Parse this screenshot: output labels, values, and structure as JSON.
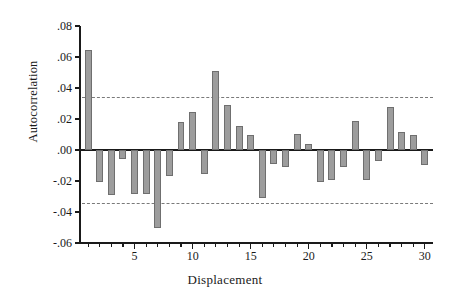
{
  "chart_data": {
    "type": "bar",
    "title": "",
    "subtitle": "",
    "xlabel": "Displacement",
    "ylabel": "Autocorrelation",
    "grid": false,
    "legend": null,
    "xlim": [
      0.3,
      30.7
    ],
    "ylim": [
      -0.06,
      0.08
    ],
    "ytick_labels": [
      ".08",
      ".06",
      ".04",
      ".02",
      ".00",
      "-.02",
      "-.04",
      "-.06"
    ],
    "ytick_values": [
      0.08,
      0.06,
      0.04,
      0.02,
      0.0,
      -0.02,
      -0.04,
      -0.06
    ],
    "xtick_labels": [
      "5",
      "10",
      "15",
      "20",
      "25",
      "30"
    ],
    "xtick_values": [
      5,
      10,
      15,
      20,
      25,
      30
    ],
    "minor_xticks": [
      1,
      2,
      3,
      4,
      5,
      6,
      7,
      8,
      9,
      10,
      11,
      12,
      13,
      14,
      15,
      16,
      17,
      18,
      19,
      20,
      21,
      22,
      23,
      24,
      25,
      26,
      27,
      28,
      29,
      30
    ],
    "annotations": [
      {
        "name": "upper-confidence-limit",
        "value": 0.034,
        "style": "dashed"
      },
      {
        "name": "lower-confidence-limit",
        "value": -0.034,
        "style": "dashed"
      }
    ],
    "categories": [
      1,
      2,
      3,
      4,
      5,
      6,
      7,
      8,
      9,
      10,
      11,
      12,
      13,
      14,
      15,
      16,
      17,
      18,
      19,
      20,
      21,
      22,
      23,
      24,
      25,
      26,
      27,
      28,
      29,
      30
    ],
    "values": [
      0.0645,
      -0.0205,
      -0.0292,
      -0.0055,
      -0.0282,
      -0.0285,
      -0.0502,
      -0.0168,
      0.018,
      0.0243,
      -0.0158,
      0.051,
      0.0288,
      0.0152,
      0.0095,
      -0.0308,
      -0.0088,
      -0.011,
      0.0105,
      0.0038,
      -0.0208,
      -0.0196,
      -0.0108,
      0.0188,
      -0.0196,
      -0.0072,
      0.0278,
      0.0115,
      0.0095,
      -0.0098
    ],
    "bar_color": "#9d9d9d",
    "bar_edge_color": "#6f6f6f",
    "axis_color": "#1a1a1a",
    "ci_color": "#7a7a7a"
  }
}
